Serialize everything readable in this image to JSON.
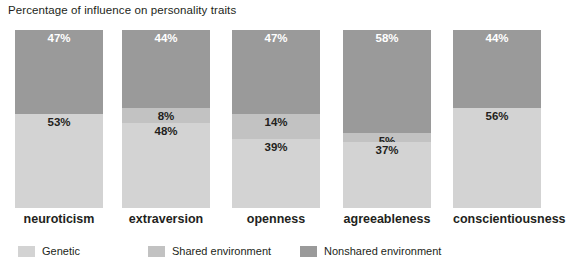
{
  "chart_data": {
    "type": "bar",
    "subtype": "100% stacked bar",
    "title": "Percentage of influence on personality traits",
    "xlabel": "",
    "ylabel": "",
    "ylim": [
      0,
      100
    ],
    "grid": false,
    "legend_position": "bottom-left",
    "stack_order_bottom_to_top": [
      "Genetic",
      "Shared environment",
      "Nonshared environment"
    ],
    "categories": [
      "neuroticism",
      "extraversion",
      "openness",
      "agreeableness",
      "conscientiousness"
    ],
    "series": [
      {
        "name": "Genetic",
        "color": "#d3d3d3",
        "values": [
          53,
          48,
          39,
          37,
          56
        ],
        "labels": [
          "53%",
          "48%",
          "39%",
          "37%",
          "56%"
        ]
      },
      {
        "name": "Shared environment",
        "color": "#c2c2c2",
        "values": [
          0,
          8,
          14,
          5,
          0
        ],
        "labels": [
          "",
          "8%",
          "14%",
          "5%",
          ""
        ]
      },
      {
        "name": "Nonshared environment",
        "color": "#9a9a9a",
        "values": [
          47,
          44,
          47,
          58,
          44
        ],
        "labels": [
          "47%",
          "44%",
          "47%",
          "58%",
          "44%"
        ]
      }
    ]
  },
  "legend": {
    "items": [
      {
        "label": "Genetic",
        "color": "#d3d3d3"
      },
      {
        "label": "Shared environment",
        "color": "#c2c2c2"
      },
      {
        "label": "Nonshared environment",
        "color": "#9a9a9a"
      }
    ]
  },
  "colors": {
    "genetic": "#d3d3d3",
    "shared_environment": "#c2c2c2",
    "nonshared_environment": "#9a9a9a",
    "text": "#231f20",
    "background": "#ffffff"
  },
  "layout": {
    "bar_left_positions": [
      15,
      122,
      232,
      343,
      453
    ],
    "bar_width": 88,
    "plot_top": 30,
    "plot_height": 178,
    "legend_left_positions": [
      18,
      148,
      300
    ]
  }
}
